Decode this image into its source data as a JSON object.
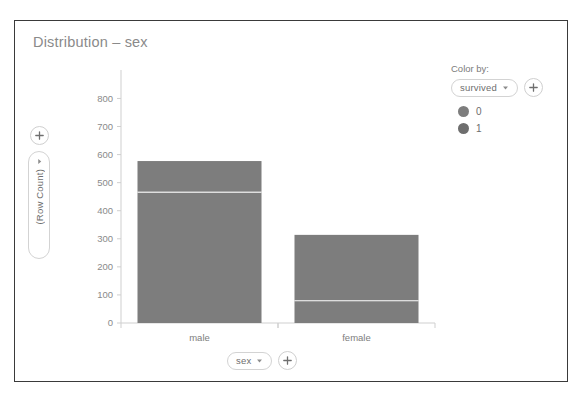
{
  "chart_data": {
    "type": "bar",
    "subtype": "stacked",
    "title": "Distribution – sex",
    "xlabel": "sex",
    "ylabel": "(Row Count)",
    "categories": [
      "male",
      "female"
    ],
    "series": [
      {
        "name": "0",
        "color": "#7d7d7d",
        "values": [
          468,
          81
        ]
      },
      {
        "name": "1",
        "color": "#707070",
        "values": [
          109,
          233
        ]
      }
    ],
    "totals": [
      577,
      314
    ],
    "ylim": [
      0,
      880
    ],
    "yticks": [
      0,
      100,
      200,
      300,
      400,
      500,
      600,
      700,
      800
    ],
    "ytick_labels": [
      "0",
      "100",
      "200",
      "300",
      "400",
      "500",
      "600",
      "700",
      "800"
    ],
    "grid": false,
    "legend_position": "right",
    "bar_color": "#7d7d7d",
    "divider_color": "#ffffff"
  },
  "card": {
    "title": "Distribution – sex"
  },
  "y_axis": {
    "add_label": "+",
    "field_label": "(Row Count)",
    "caret": "▾"
  },
  "x_axis": {
    "field_label": "sex",
    "add_label": "+",
    "caret": "▾",
    "categories": [
      "male",
      "female"
    ]
  },
  "legend": {
    "heading": "Color by:",
    "selected_field": "survived",
    "caret": "▾",
    "add_label": "+",
    "items": [
      {
        "label": "0",
        "color": "#7d7d7d"
      },
      {
        "label": "1",
        "color": "#6e6e6e"
      }
    ]
  },
  "colors": {
    "card_border": "#3a3a3a",
    "title_text": "#8a8a8a",
    "axis_line": "#cfcfcf",
    "tick_text": "#8a8a8a",
    "pill_border": "#d3d3d3",
    "bar": "#7d7d7d"
  }
}
